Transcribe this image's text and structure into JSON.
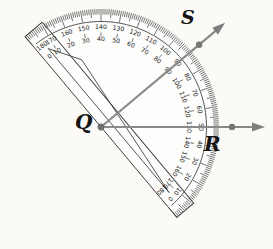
{
  "figure": {
    "type": "geometry-protractor-diagram",
    "background": "#fbfaf7",
    "labels": {
      "vertex": "Q",
      "right_ray_point": "R",
      "upper_ray_point": "S"
    },
    "protractor": {
      "rotation_deg": 50,
      "outer_scale_labels": [
        180,
        170,
        160,
        150,
        140,
        130,
        120,
        110,
        100,
        90,
        80,
        70,
        60,
        50,
        40,
        30,
        20,
        10,
        0
      ],
      "inner_scale_labels": [
        0,
        10,
        20,
        30,
        40,
        50,
        60,
        70,
        80,
        90,
        100,
        110,
        120,
        130,
        140,
        150,
        160,
        170,
        180
      ],
      "tick_step_deg": 1
    },
    "rays": [
      {
        "name": "QR",
        "direction_deg": 0,
        "protractor_reading_inner": 130,
        "protractor_reading_outer": 50
      },
      {
        "name": "QS",
        "direction_deg": 40,
        "protractor_reading_inner": 90,
        "protractor_reading_outer": 90
      }
    ],
    "measured_angle_SQR_deg": 40,
    "colors": {
      "outline": "#3c3c3c",
      "tick": "#3a3a3a",
      "number": "#1c1c1c",
      "ray": "#8a8a8a",
      "arrow": "#7e7e7e",
      "dot": "#757575",
      "vertex_dot": "#6e6e6e"
    }
  }
}
